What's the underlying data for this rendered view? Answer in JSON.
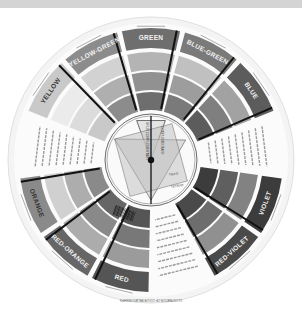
{
  "image": {
    "subject": "Color wheel (grayscale photograph)",
    "bottom_title": "ILLUSTRATION OF COLOR RELATIONSHIPS",
    "segments": [
      {
        "label": "GREEN",
        "shade": "#6e6e6e",
        "text_dark": false
      },
      {
        "label": "BLUE-GREEN",
        "shade": "#7a7a7a",
        "text_dark": false
      },
      {
        "label": "BLUE",
        "shade": "#5c5c5c",
        "text_dark": false
      },
      {
        "label": "",
        "shade": "#ffffff",
        "text_dark": true,
        "is_text_panel": true
      },
      {
        "label": "VIOLET",
        "shade": "#3c3c3c",
        "text_dark": false
      },
      {
        "label": "RED-VIOLET",
        "shade": "#4a4a4a",
        "text_dark": false
      },
      {
        "label": "",
        "shade": "#ffffff",
        "text_dark": true,
        "is_text_panel": true
      },
      {
        "label": "RED",
        "shade": "#555555",
        "text_dark": false
      },
      {
        "label": "RED-ORANGE",
        "shade": "#666666",
        "text_dark": false
      },
      {
        "label": "ORANGE",
        "shade": "#8a8a8a",
        "text_dark": true
      },
      {
        "label": "",
        "shade": "#ffffff",
        "text_dark": true,
        "is_text_panel": true
      },
      {
        "label": "YELLOW",
        "shade": "#c9c9c9",
        "text_dark": true
      },
      {
        "label": "YELLOW-GREEN",
        "shade": "#8c8c8c",
        "text_dark": false
      }
    ],
    "small_labels": {
      "pure_color": "PURE COLOR",
      "pure_color_bottom": "PURE COLOR",
      "tints": "TINTS",
      "shades": "SHADES"
    },
    "center_labels": {
      "split_complementary": "SPLIT COMPLEMENTARY",
      "complementary": "COMPLEMENTARY",
      "triad": "TRIAD",
      "tetrad": "TETRAD"
    }
  }
}
